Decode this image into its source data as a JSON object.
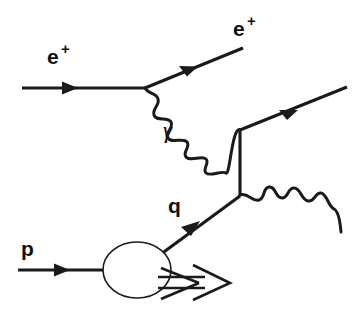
{
  "figure": {
    "kind": "feynman-diagram",
    "background_color": "#ffffff",
    "line_color": "#1a1a1a",
    "width": 363,
    "height": 314
  },
  "labels": {
    "incoming_positron": {
      "base": "e",
      "superscript": "+"
    },
    "outgoing_positron": {
      "base": "e",
      "superscript": "+"
    },
    "photon": "γ",
    "quark": "q",
    "proton": "p"
  },
  "particles": [
    {
      "id": "incoming-positron",
      "name": "incoming positron",
      "label": "e+",
      "line_style": "straight-arrow",
      "direction": "rightward",
      "from": [
        22,
        88
      ],
      "to": [
        145,
        88
      ]
    },
    {
      "id": "outgoing-positron",
      "name": "outgoing positron",
      "label": "e+",
      "line_style": "straight-arrow",
      "direction": "up-right",
      "from": [
        145,
        88
      ],
      "to": [
        243,
        48
      ]
    },
    {
      "id": "exchanged-photon",
      "name": "virtual photon",
      "label": "γ",
      "line_style": "wavy",
      "from": [
        145,
        88
      ],
      "to": [
        240,
        130
      ]
    },
    {
      "id": "upper-outgoing-fermion",
      "name": "outgoing fermion from upper vertex",
      "label": "",
      "line_style": "straight-arrow",
      "direction": "up-right",
      "from": [
        240,
        130
      ],
      "to": [
        345,
        88
      ]
    },
    {
      "id": "internal-propagator",
      "name": "internal fermion propagator",
      "label": "",
      "line_style": "straight",
      "from": [
        240,
        130
      ],
      "to": [
        240,
        195
      ]
    },
    {
      "id": "incoming-quark",
      "name": "struck quark from proton",
      "label": "q",
      "line_style": "straight-arrow",
      "direction": "up-right",
      "from": [
        160,
        255
      ],
      "to": [
        240,
        195
      ]
    },
    {
      "id": "lower-outgoing-boson",
      "name": "outgoing boson from lower vertex",
      "label": "",
      "line_style": "wavy",
      "from": [
        240,
        195
      ],
      "to": [
        342,
        232
      ]
    },
    {
      "id": "incoming-proton",
      "name": "incoming proton",
      "label": "p",
      "line_style": "straight-arrow",
      "direction": "rightward",
      "from": [
        18,
        270
      ],
      "to": [
        104,
        270
      ]
    },
    {
      "id": "proton-remnant-jet",
      "name": "proton remnant jet",
      "label": "",
      "line_style": "open-block-arrow",
      "from": [
        160,
        280
      ],
      "to": [
        228,
        288
      ]
    }
  ],
  "vertices": [
    {
      "id": "positron-photon-vertex",
      "name": "positron emits photon",
      "at": [
        145,
        88
      ]
    },
    {
      "id": "upper-vertex",
      "name": "photon absorbed / fermion vertex",
      "at": [
        240,
        130
      ]
    },
    {
      "id": "lower-vertex",
      "name": "quark vertex emitting boson",
      "at": [
        240,
        195
      ]
    }
  ],
  "blob": {
    "id": "proton-blob",
    "name": "proton structure blob",
    "center": [
      137,
      270
    ],
    "radius_x": 34,
    "radius_y": 28
  }
}
